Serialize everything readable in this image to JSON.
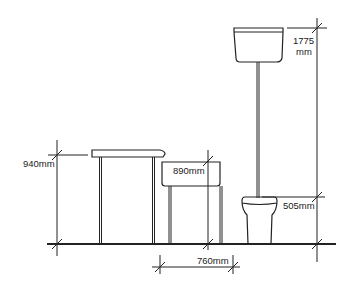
{
  "diagram": {
    "line_color": "#222222",
    "fixtures": [
      {
        "name": "counter",
        "dimension_label": "940mm"
      },
      {
        "name": "wash-basin",
        "dimension_label": "890mm"
      },
      {
        "name": "toilet-pan",
        "dimension_label": "505mm"
      },
      {
        "name": "high-level-cistern",
        "dimension_label_line1": "1775",
        "dimension_label_line2": "mm"
      }
    ],
    "clearance": {
      "dimension_label": "760mm"
    }
  }
}
